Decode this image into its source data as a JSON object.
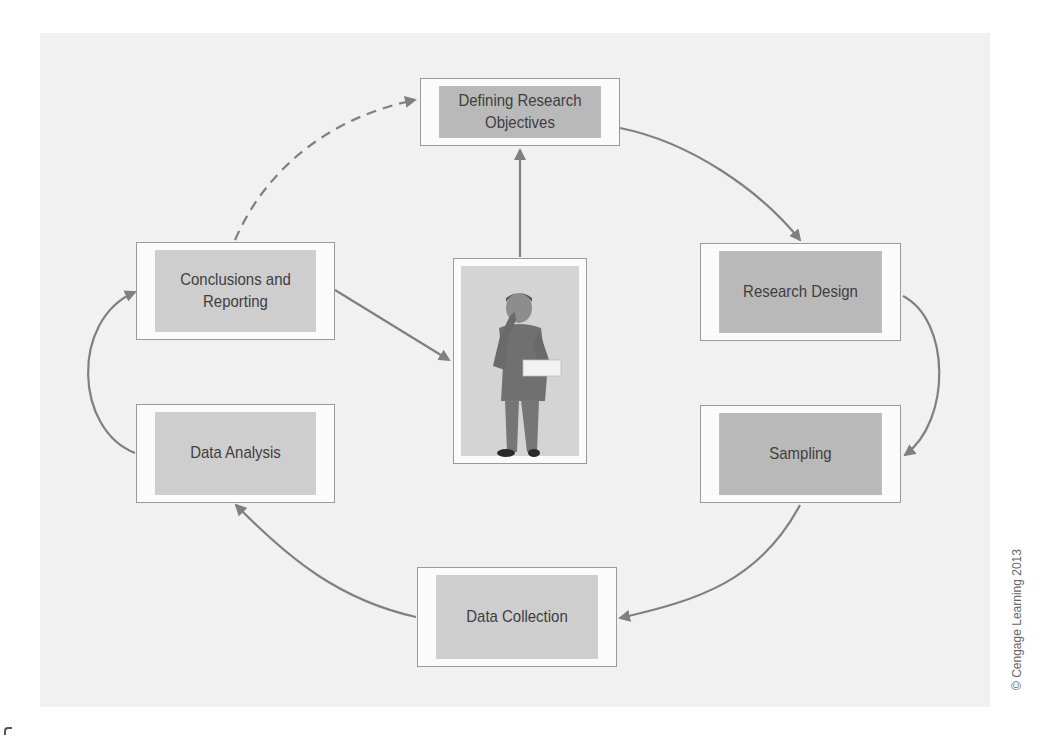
{
  "diagram": {
    "nodes": {
      "defining": {
        "line1": "Defining Research",
        "line2": "Objectives",
        "shade": "dark"
      },
      "design": {
        "label": "Research Design",
        "shade": "dark"
      },
      "sampling": {
        "label": "Sampling",
        "shade": "dark"
      },
      "collection": {
        "label": "Data Collection",
        "shade": "light"
      },
      "analysis": {
        "label": "Data Analysis",
        "shade": "light"
      },
      "conclusions": {
        "line1": "Conclusions and",
        "line2": "Reporting",
        "shade": "light"
      },
      "researcher": {
        "label": "Researcher (illustration of man in suit holding papers)"
      }
    },
    "edges": [
      {
        "from": "defining",
        "to": "design",
        "style": "solid"
      },
      {
        "from": "design",
        "to": "sampling",
        "style": "solid"
      },
      {
        "from": "sampling",
        "to": "collection",
        "style": "solid"
      },
      {
        "from": "collection",
        "to": "analysis",
        "style": "solid"
      },
      {
        "from": "analysis",
        "to": "conclusions",
        "style": "solid"
      },
      {
        "from": "conclusions",
        "to": "researcher",
        "style": "solid"
      },
      {
        "from": "researcher",
        "to": "defining",
        "style": "solid"
      },
      {
        "from": "conclusions",
        "to": "defining",
        "style": "dashed"
      }
    ],
    "colors": {
      "panel": "#f1f1f1",
      "dark_box": "#b9b9b9",
      "light_box": "#cecece",
      "arrow": "#808080"
    }
  },
  "credit": "© Cengage Learning 2013"
}
